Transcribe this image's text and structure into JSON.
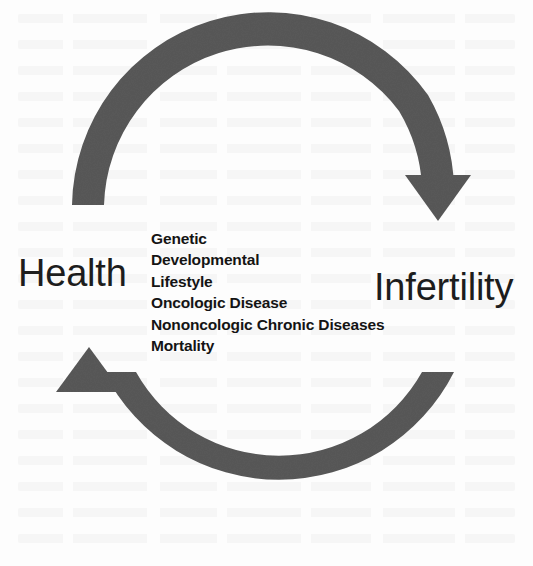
{
  "diagram": {
    "type": "cyclic-arrow-diagram",
    "background_color": "#fdfdfd",
    "arrow_color": "#595959",
    "text_color": "#1d1d1d",
    "nodes": [
      {
        "id": "health",
        "label": "Health",
        "position": "left"
      },
      {
        "id": "infertility",
        "label": "Infertility",
        "position": "right"
      }
    ],
    "arrows": [
      {
        "id": "health-to-infertility",
        "name": "top-arc-arrow",
        "from": "Health",
        "to": "Infertility",
        "direction": "clockwise-top",
        "head": "down-arrowhead"
      },
      {
        "id": "infertility-to-health",
        "name": "bottom-arc-arrow",
        "from": "Infertility",
        "to": "Health",
        "direction": "clockwise-bottom",
        "head": "up-arrowhead"
      }
    ],
    "factors": {
      "heading": "",
      "items": [
        "Genetic",
        "Developmental",
        "Lifestyle",
        "Oncologic Disease",
        "Nononcologic Chronic Diseases",
        "Mortality"
      ]
    }
  }
}
